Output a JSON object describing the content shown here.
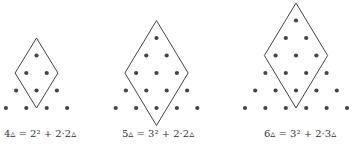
{
  "figures": [
    {
      "n": 4,
      "label": "4▵ = 2² + 2·2▵",
      "rows": 4
    },
    {
      "n": 5,
      "label": "5▵ = 3² + 2·2▵",
      "rows": 5
    },
    {
      "n": 6,
      "label": "6▵ = 3² + 2·3▵",
      "rows": 6
    }
  ],
  "colors": {
    "dot": "#444444",
    "line": "#444444"
  }
}
